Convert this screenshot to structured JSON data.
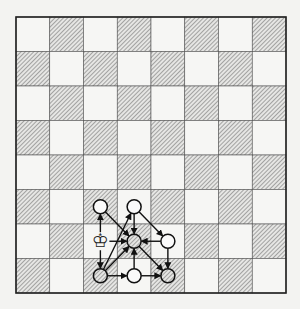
{
  "diagram": {
    "type": "chessboard-move-graph",
    "board": {
      "files": 8,
      "ranks": 8,
      "origin_x": 16,
      "origin_y": 17,
      "square_w": 33.75,
      "square_h": 34.5,
      "light_color": "#f6f6f4",
      "dark_pattern": "diagonal-hatch",
      "hatch_color": "#6a6a6a",
      "border_color": "#222222",
      "top_left_square": "light"
    },
    "pieces": [
      {
        "name": "white-king",
        "glyph": "♔",
        "row": 6,
        "col": 2
      }
    ],
    "nodes": [
      {
        "id": "A",
        "row": 5,
        "col": 2,
        "fill": "white"
      },
      {
        "id": "B",
        "row": 5,
        "col": 3,
        "fill": "white"
      },
      {
        "id": "C",
        "row": 6,
        "col": 3,
        "fill": "hatched"
      },
      {
        "id": "D",
        "row": 6,
        "col": 4,
        "fill": "white"
      },
      {
        "id": "E",
        "row": 7,
        "col": 2,
        "fill": "hatched"
      },
      {
        "id": "F",
        "row": 7,
        "col": 3,
        "fill": "white"
      },
      {
        "id": "G",
        "row": 7,
        "col": 4,
        "fill": "hatched"
      }
    ],
    "arrows": [
      {
        "from": "K",
        "to": "A"
      },
      {
        "from": "K",
        "to": "E"
      },
      {
        "from": "K",
        "to": "C"
      },
      {
        "from": "A",
        "to": "C"
      },
      {
        "from": "B",
        "to": "C"
      },
      {
        "from": "B",
        "to": "D"
      },
      {
        "from": "E",
        "to": "B"
      },
      {
        "from": "D",
        "to": "C"
      },
      {
        "from": "E",
        "to": "C"
      },
      {
        "from": "F",
        "to": "C"
      },
      {
        "from": "C",
        "to": "G"
      },
      {
        "from": "D",
        "to": "G"
      },
      {
        "from": "E",
        "to": "F"
      },
      {
        "from": "F",
        "to": "G"
      }
    ]
  }
}
